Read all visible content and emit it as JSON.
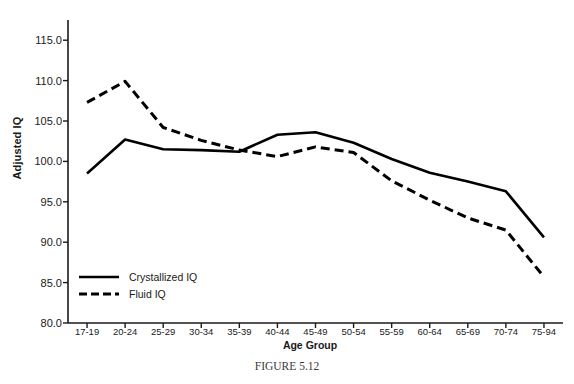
{
  "caption": {
    "prefix": "F",
    "word_rest": "IGURE",
    "number": "5.12",
    "full": "FIGURE 5.12"
  },
  "chart_data": {
    "type": "line",
    "title": "",
    "xlabel": "Age Group",
    "ylabel": "Adjusted IQ",
    "categories": [
      "17-19",
      "20-24",
      "25-29",
      "30-34",
      "35-39",
      "40-44",
      "45-49",
      "50-54",
      "55-59",
      "60-64",
      "65-69",
      "70-74",
      "75-94"
    ],
    "ylim": [
      80.0,
      117.5
    ],
    "yticks": [
      80.0,
      85.0,
      90.0,
      95.0,
      100.0,
      105.0,
      110.0,
      115.0
    ],
    "ytick_labels": [
      "80.0",
      "85.0",
      "90.0",
      "95.0",
      "100.0",
      "105.0",
      "110.0",
      "115.0"
    ],
    "grid": false,
    "legend_position": "lower-left-inside",
    "series": [
      {
        "name": "Crystallized IQ",
        "style": "solid",
        "color": "#000000",
        "values": [
          98.5,
          102.7,
          101.5,
          101.4,
          101.2,
          103.3,
          103.6,
          102.3,
          100.3,
          98.6,
          97.5,
          96.3,
          90.6
        ]
      },
      {
        "name": "Fluid IQ",
        "style": "dashed",
        "color": "#000000",
        "values": [
          107.3,
          109.9,
          104.2,
          102.6,
          101.4,
          100.6,
          101.8,
          101.1,
          97.6,
          95.2,
          93.0,
          91.5,
          85.7
        ]
      }
    ]
  },
  "legend": {
    "items": [
      {
        "label": "Crystallized IQ",
        "style": "solid"
      },
      {
        "label": "Fluid IQ",
        "style": "dashed"
      }
    ]
  },
  "colors": {
    "axis": "#1a1a1a",
    "line": "#000000",
    "background": "#ffffff",
    "caption_text": "#3a3a3a"
  }
}
